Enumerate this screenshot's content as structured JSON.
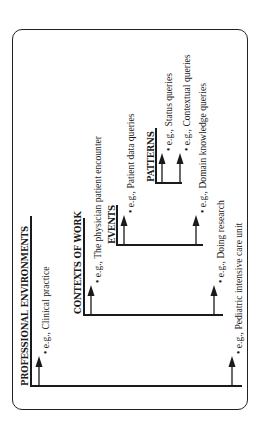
{
  "diagram": {
    "type": "hierarchy",
    "orientation": "rotated-90-ccw",
    "colors": {
      "ink": "#1a1a1a",
      "background": "#ffffff"
    },
    "levels": [
      {
        "header": "PROFESSIONAL ENVIRONMENTS",
        "examples": [
          "e.g., Clinical practice",
          "e.g., Pediatric intensive care unit"
        ]
      },
      {
        "header": "CONTEXTS OF WORK",
        "examples": [
          "e.g., The physician patient encounter",
          "e.g., Doing research"
        ]
      },
      {
        "header": "EVENTS",
        "examples": [
          "e.g., Patient data queries",
          "e.g., Domain knowledge queries"
        ]
      },
      {
        "header": "PATTERNS",
        "examples": [
          "e.g., Status queries",
          "e.g., Contextual queries"
        ]
      }
    ]
  }
}
